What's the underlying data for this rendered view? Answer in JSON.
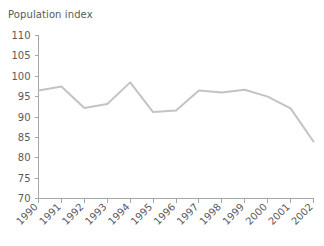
{
  "chart_data": {
    "type": "line",
    "title": "Population index",
    "xlabel": "",
    "ylabel": "",
    "x": [
      1990,
      1991,
      1992,
      1993,
      1994,
      1995,
      1996,
      1997,
      1998,
      1999,
      2000,
      2001,
      2002
    ],
    "categories": [
      "1990",
      "1991",
      "1992",
      "1993",
      "1994",
      "1995",
      "1996",
      "1997",
      "1998",
      "1999",
      "2000",
      "2001",
      "2002"
    ],
    "values": [
      96.5,
      97.5,
      92.2,
      93.2,
      98.5,
      91.2,
      91.6,
      96.5,
      96.0,
      96.7,
      95.0,
      92.1,
      84.0
    ],
    "series": [
      {
        "name": "Population index",
        "values": [
          96.5,
          97.5,
          92.2,
          93.2,
          98.5,
          91.2,
          91.6,
          96.5,
          96.0,
          96.7,
          95.0,
          92.1,
          84.0
        ]
      }
    ],
    "ylim": [
      70,
      110
    ],
    "yticks": [
      110,
      105,
      100,
      95,
      90,
      85,
      80,
      75,
      70
    ],
    "ytick_labels": [
      "110",
      "105",
      "100",
      "95",
      "90",
      "85",
      "80",
      "75",
      "70"
    ],
    "xtick_labels": [
      "1990",
      "1991",
      "1992",
      "1993",
      "1994",
      "1995",
      "1996",
      "1997",
      "1998",
      "1999",
      "2000",
      "2001",
      "2002"
    ],
    "xtick_rotation": 45,
    "grid": false,
    "legend": false,
    "legend_position": "none",
    "line_color": "#c3c3c3",
    "axis_color": "#a6a6a6",
    "text_color": "#5a5a5a",
    "background_color": "#ffffff"
  }
}
